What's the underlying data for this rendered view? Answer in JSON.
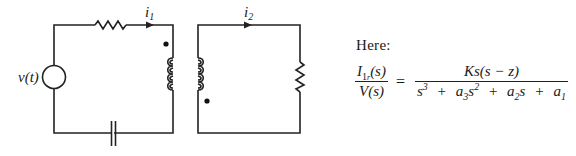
{
  "diagram": {
    "type": "transformer-coupled-circuit",
    "source_label": "v(t)",
    "current_1": {
      "symbol": "i",
      "subscript": "1"
    },
    "current_2": {
      "symbol": "i",
      "subscript": "2"
    },
    "loop_1": {
      "components": [
        "voltage-source",
        "resistor",
        "primary-inductor",
        "capacitor"
      ],
      "dot_position": "top of primary coil"
    },
    "loop_2": {
      "components": [
        "secondary-inductor",
        "resistor"
      ],
      "dot_position": "bottom of secondary coil"
    },
    "colors": {
      "line": "#222222",
      "background": "#ffffff"
    }
  },
  "text": {
    "here_label": "Here:",
    "equation": {
      "lhs_numerator": {
        "symbol": "I",
        "subscript": "1",
        "sub_subscript": "r",
        "argument": "(s)"
      },
      "lhs_denominator": "V(s)",
      "equals": "=",
      "rhs_numerator": "Ks(s − z)",
      "rhs_denominator": {
        "term1": {
          "base": "s",
          "exp": "3"
        },
        "op1": "+",
        "term2": {
          "coef": "a",
          "coef_sub": "3",
          "base": "s",
          "exp": "2"
        },
        "op2": "+",
        "term3": {
          "coef": "a",
          "coef_sub": "2",
          "base": "s"
        },
        "op3": "+",
        "term4": {
          "coef": "a",
          "coef_sub": "1"
        }
      }
    }
  }
}
